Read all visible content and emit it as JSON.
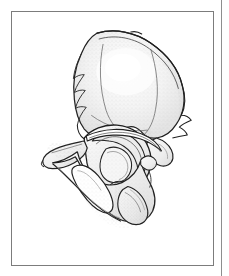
{
  "page": {
    "background_color": "#ffffff",
    "width": 229,
    "height": 276
  },
  "column_rule": {
    "name": "page-column-rule",
    "color": "#8e8e8e",
    "x": 221
  },
  "figure": {
    "frame": {
      "border_color": "#7c7c7c",
      "background_color": "#ffffff",
      "x": 11,
      "y": 11,
      "width": 203,
      "height": 255
    },
    "caption": "",
    "illustration": {
      "subject": "hip-bone-os-coxae-lateral-view",
      "style": "pen-and-ink line drawing with stipple shading",
      "outline_color": "#1f1f1f",
      "fill_color": "#f4f4f4",
      "shade_color": "#d8d8d8",
      "stipple_color": "#9a9a9a",
      "highlight_color": "#fcfcfc",
      "parts": [
        {
          "id": "ilium",
          "label": "Ilium (iliac wing)"
        },
        {
          "id": "iliac-crest",
          "label": "Iliac crest"
        },
        {
          "id": "anterior-superior-iliac-spine",
          "label": "Anterior superior iliac spine"
        },
        {
          "id": "anterior-inferior-iliac-spine",
          "label": "Anterior inferior iliac spine"
        },
        {
          "id": "posterior-iliac-spine",
          "label": "Posterior iliac spine"
        },
        {
          "id": "acetabulum",
          "label": "Acetabulum"
        },
        {
          "id": "lunate-surface",
          "label": "Lunate surface"
        },
        {
          "id": "acetabular-notch",
          "label": "Acetabular notch"
        },
        {
          "id": "greater-sciatic-notch",
          "label": "Greater sciatic notch"
        },
        {
          "id": "obturator-foramen",
          "label": "Obturator foramen"
        },
        {
          "id": "superior-pubic-ramus",
          "label": "Superior pubic ramus"
        },
        {
          "id": "pubic-body",
          "label": "Body of pubis"
        },
        {
          "id": "ischial-tuberosity",
          "label": "Ischial tuberosity"
        },
        {
          "id": "ischial-ramus",
          "label": "Ramus of ischium"
        },
        {
          "id": "ischial-spine",
          "label": "Ischial spine"
        }
      ]
    }
  }
}
